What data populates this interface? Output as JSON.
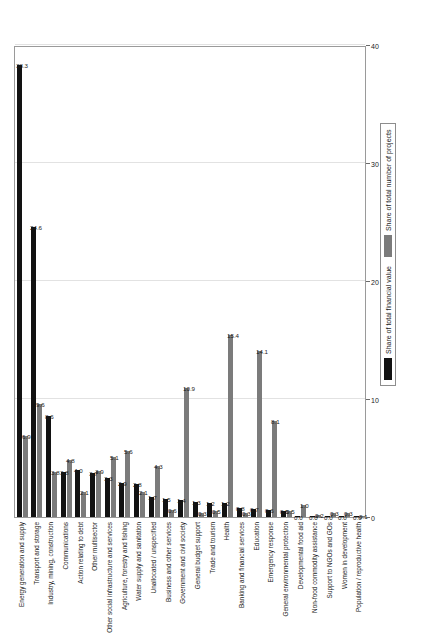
{
  "chart": {
    "type": "bar",
    "orientation": "rotated-90",
    "axis": {
      "ticks": [
        "0",
        "10",
        "20",
        "30",
        "40"
      ],
      "min": 0,
      "max": 40
    },
    "legend": {
      "position": "bottom-right",
      "items": [
        {
          "label": "Share of total financial value",
          "color": "#121212",
          "key": "financial"
        },
        {
          "label": "Share of total number of projects",
          "color": "#7b7b7b",
          "key": "projects"
        }
      ]
    }
  },
  "chart_data": {
    "type": "bar",
    "title": "",
    "subtitle": "",
    "xlabel": "",
    "ylabel": "",
    "ylim": [
      0,
      40
    ],
    "grid": true,
    "legend_position": "bottom-right",
    "categories": [
      "Energy generation and supply",
      "Transport and storage",
      "Industry, mining, construction",
      "Communications",
      "Action relating to debt",
      "Other multisector",
      "Other social infrastructure and services",
      "Agriculture, forestry and fishing",
      "Water supply and sanitation",
      "Unallocated / unspecified",
      "Business and other services",
      "Government and civil society",
      "General budget support",
      "Trade and tourism",
      "Health",
      "Banking and financial services",
      "Education",
      "Emergency response",
      "General environmental protection",
      "Developmental food aid",
      "Non-food commodity assistance",
      "Support to NGOs and GOs",
      "Women in development",
      "Population / reproductive health"
    ],
    "series": [
      {
        "name": "Share of total financial value",
        "color": "#121212",
        "values": [
          38.3,
          24.6,
          8.6,
          3.8,
          4.0,
          3.7,
          3.3,
          2.9,
          2.8,
          1.7,
          1.5,
          1.4,
          1.3,
          1.2,
          1.2,
          0.8,
          0.7,
          0.6,
          0.5,
          0.0,
          0.0,
          0.0,
          0.0,
          0.0
        ]
      },
      {
        "name": "Share of total number of projects",
        "color": "#7b7b7b",
        "values": [
          6.9,
          9.6,
          3.8,
          4.8,
          2.1,
          3.9,
          5.1,
          5.6,
          2.1,
          4.3,
          0.6,
          10.9,
          0.3,
          0.5,
          15.4,
          0.3,
          14.1,
          8.1,
          0.5,
          1.0,
          0.2,
          0.3,
          0.3,
          0.1
        ]
      }
    ],
    "value_labels": {
      "financial": [
        "38.3",
        "24.6",
        "8.6",
        "3.8",
        "4.0",
        "3.7",
        "3.3",
        "2.9",
        "2.8",
        "1.7",
        "1.5",
        "1.4",
        "1.3",
        "1.2",
        "1.2",
        "0.8",
        "0.7",
        "0.6",
        "0.5",
        "0.0",
        "0.0",
        "0.0",
        "0.0",
        "0.0"
      ],
      "projects": [
        "6.9",
        "9.6",
        "3.8",
        "4.8",
        "2.1",
        "3.9",
        "5.1",
        "5.6",
        "2.1",
        "4.3",
        "0.6",
        "10.9",
        "0.3",
        "0.5",
        "15.4",
        "0.3",
        "14.1",
        "8.1",
        "0.5",
        "1.0",
        "0.2",
        "0.3",
        "0.3",
        "0.1"
      ]
    }
  }
}
